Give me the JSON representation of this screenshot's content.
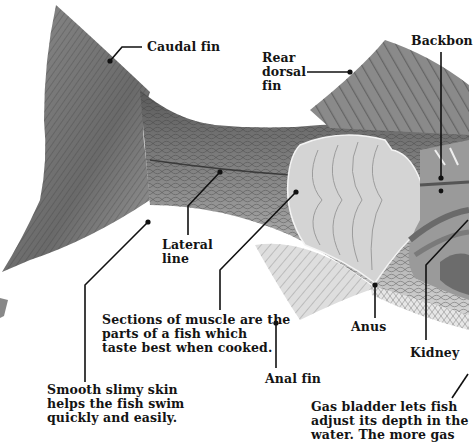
{
  "diagram": {
    "colors": {
      "background": "#ffffff",
      "text": "#141414",
      "leader_line": "#111111",
      "fin_dark": "#6e6e6e",
      "body_scales": "#8a8a8a",
      "muscle": "#d6d6d6",
      "organs": "#9a9a9a"
    },
    "labels": {
      "caudal_fin": {
        "lines": [
          "Caudal fin"
        ]
      },
      "rear_dorsal_fin": {
        "lines": [
          "Rear",
          "dorsal",
          "fin"
        ]
      },
      "backbone": {
        "lines": [
          "Backbon"
        ]
      },
      "lateral_line": {
        "lines": [
          "Lateral",
          "line"
        ]
      },
      "muscle": {
        "lines": [
          "Sections of muscle are the",
          "parts of a fish which",
          "taste best when cooked."
        ]
      },
      "anus": {
        "lines": [
          "Anus"
        ]
      },
      "kidney": {
        "lines": [
          "Kidney"
        ]
      },
      "anal_fin": {
        "lines": [
          "Anal fin"
        ]
      },
      "skin": {
        "lines": [
          "Smooth slimy skin",
          "helps the fish swim",
          "quickly and easily."
        ]
      },
      "gas_bladder": {
        "lines": [
          "Gas bladder lets fish",
          "adjust its depth in the",
          "water. The more gas"
        ]
      }
    }
  }
}
